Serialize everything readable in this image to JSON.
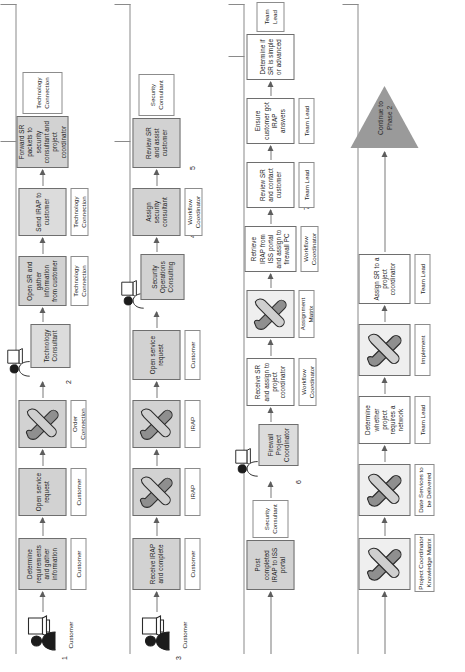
{
  "diagram": {
    "terminator": "Continue to Phase 2",
    "lanes": [
      {
        "id": "lane-1",
        "step_number": "1",
        "actor_icon": "person-at-computer-icon",
        "actor_label": "Customer",
        "nodes": [
          {
            "text": "Determine requirements and gather information",
            "caption": "Customer",
            "style": "shaded",
            "kind": "process"
          },
          {
            "text": "Open service request",
            "caption": "Customer",
            "style": "shaded",
            "kind": "process"
          },
          {
            "text": "",
            "caption": "Order Connection",
            "style": "shaded",
            "kind": "tool",
            "icon": "wrench-screwdriver-icon"
          },
          {
            "text": "",
            "caption": "Technology Consultant",
            "style": "light",
            "kind": "role",
            "icon": "person-at-computer-icon",
            "step_number": "2"
          },
          {
            "text": "Open SR and gather information from customer",
            "caption": "Technology Connection",
            "style": "shaded",
            "kind": "process"
          },
          {
            "text": "Send IRAP to customer",
            "caption": "Technology Connection",
            "style": "light",
            "kind": "process"
          },
          {
            "text": "Forward SR packets to security consultant and project coordinator",
            "caption": "Technology Connection",
            "style": "shaded",
            "kind": "process"
          }
        ]
      },
      {
        "id": "lane-2",
        "step_number": "3",
        "actor_icon": "person-at-computer-icon",
        "actor_label": "Customer",
        "nodes": [
          {
            "text": "Receive IRAP and complete",
            "caption": "Customer",
            "style": "shaded",
            "kind": "process"
          },
          {
            "text": "",
            "caption": "IRAP",
            "style": "shaded",
            "kind": "tool",
            "icon": "wrench-screwdriver-icon"
          },
          {
            "text": "",
            "caption": "IRAP",
            "style": "shaded",
            "kind": "tool",
            "icon": "wrench-screwdriver-icon"
          },
          {
            "text": "Open service request",
            "caption": "Customer",
            "style": "shaded",
            "kind": "process"
          },
          {
            "text": "Security Operations Consulting",
            "caption": "",
            "style": "shaded",
            "kind": "role",
            "icon": "person-at-computer-icon"
          },
          {
            "text": "Assign security consultant",
            "caption": "Workflow Coordinator",
            "style": "shaded",
            "kind": "process",
            "step_number": "4"
          },
          {
            "text": "Review SR and assist customer",
            "caption": "Security Consultant",
            "style": "shaded",
            "kind": "process",
            "step_number": "5"
          }
        ]
      },
      {
        "id": "lane-3",
        "step_number": "6",
        "actor_icon": "person-at-computer-icon",
        "actor_label": "",
        "nodes": [
          {
            "text": "Post completed IRAP to ISS portal",
            "caption": "Security Consultant",
            "style": "shaded",
            "kind": "process"
          },
          {
            "text": "Firewall Project Coordinator",
            "caption": "",
            "style": "light",
            "kind": "role",
            "icon": "person-at-computer-icon",
            "step_number": "6"
          },
          {
            "text": "Receive SR and assign to project coordinator",
            "caption": "Workflow Coordinator",
            "style": "plain",
            "kind": "process"
          },
          {
            "text": "",
            "caption": "Assignment Matrix",
            "style": "plain",
            "kind": "tool",
            "icon": "wrench-screwdriver-icon"
          },
          {
            "text": "Retrieve IRAP from ISS portal and assign to firewall PC",
            "caption": "Workflow Coordinator",
            "style": "plain",
            "kind": "process"
          },
          {
            "text": "Review SR and contact customer",
            "caption": "Team Lead",
            "style": "plain",
            "kind": "process",
            "step_number": "7"
          },
          {
            "text": "Ensure customer got IRAP answers",
            "caption": "Team Lead",
            "style": "plain",
            "kind": "process"
          },
          {
            "text": "Determine if SR is simple or advanced",
            "caption": "Team Lead",
            "style": "plain",
            "kind": "process"
          }
        ]
      },
      {
        "id": "lane-4",
        "step_number": "",
        "actor_icon": "",
        "actor_label": "",
        "nodes": [
          {
            "text": "",
            "caption": "Project Coordinator Knowledge Matrix",
            "style": "plain",
            "kind": "tool",
            "icon": "wrench-screwdriver-icon"
          },
          {
            "text": "",
            "caption": "Date Services to be Delivered",
            "style": "plain",
            "kind": "tool",
            "icon": "wrench-screwdriver-icon"
          },
          {
            "text": "Determine whether project requires a network",
            "caption": "Team Lead",
            "style": "plain",
            "kind": "process"
          },
          {
            "text": "",
            "caption": "Implement",
            "style": "plain",
            "kind": "tool",
            "icon": "wrench-screwdriver-icon"
          },
          {
            "text": "Assign SR to a project coordinator",
            "caption": "Team Lead",
            "style": "plain",
            "kind": "process"
          }
        ]
      }
    ]
  },
  "colors": {
    "shaded_fill": "#d2d2d2",
    "light_fill": "#dcdcdc",
    "plain_fill": "#ffffff",
    "stroke": "#6e6e6e",
    "terminator_fill": "#9a9a9a",
    "connector": "#8a8a8a"
  }
}
